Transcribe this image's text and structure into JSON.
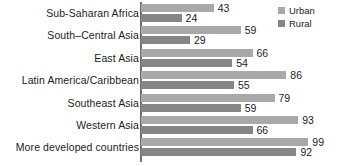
{
  "chart_data": {
    "type": "bar",
    "orientation": "horizontal",
    "title": "",
    "subtitle": "",
    "xlabel": "",
    "ylabel": "",
    "xlim": [
      0,
      100
    ],
    "grid": false,
    "legend_position": "top-right",
    "categories": [
      "Sub-Saharan Africa",
      "South–Central Asia",
      "East Asia",
      "Latin America/Caribbean",
      "Southeast Asia",
      "Western Asia",
      "More developed countries"
    ],
    "series": [
      {
        "name": "Urban",
        "color": "#a9a9a9",
        "values": [
          43,
          59,
          66,
          86,
          79,
          93,
          99
        ]
      },
      {
        "name": "Rural",
        "color": "#868686",
        "values": [
          24,
          29,
          54,
          55,
          59,
          66,
          92
        ]
      }
    ]
  },
  "legend": {
    "items": [
      {
        "label": "Urban",
        "color": "#a9a9a9"
      },
      {
        "label": "Rural",
        "color": "#868686"
      }
    ]
  },
  "axis": {
    "color": "#6e6e6e"
  }
}
